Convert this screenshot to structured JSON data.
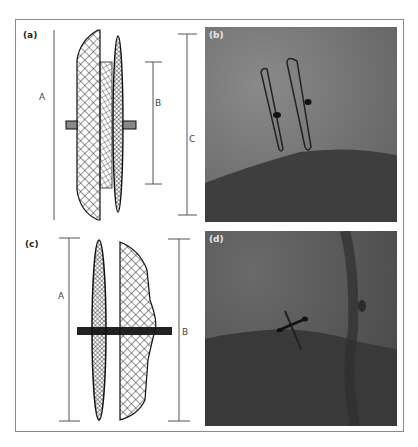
{
  "figure": {
    "panels": [
      {
        "id": "a",
        "label": "(a)",
        "type": "device-drawing",
        "dimension_labels": [
          "A",
          "B",
          "C"
        ]
      },
      {
        "id": "b",
        "label": "(b)",
        "type": "fluoroscopy-image"
      },
      {
        "id": "c",
        "label": "(c)",
        "type": "device-drawing",
        "dimension_labels": [
          "A",
          "B"
        ]
      },
      {
        "id": "d",
        "label": "(d)",
        "type": "fluoroscopy-image"
      }
    ],
    "colors": {
      "border": "#8a8a8a",
      "line": "#444444",
      "mesh": "#1a1a1a",
      "xray_light": "#7a7a7a",
      "xray_dark": "#3a3a3a"
    }
  }
}
